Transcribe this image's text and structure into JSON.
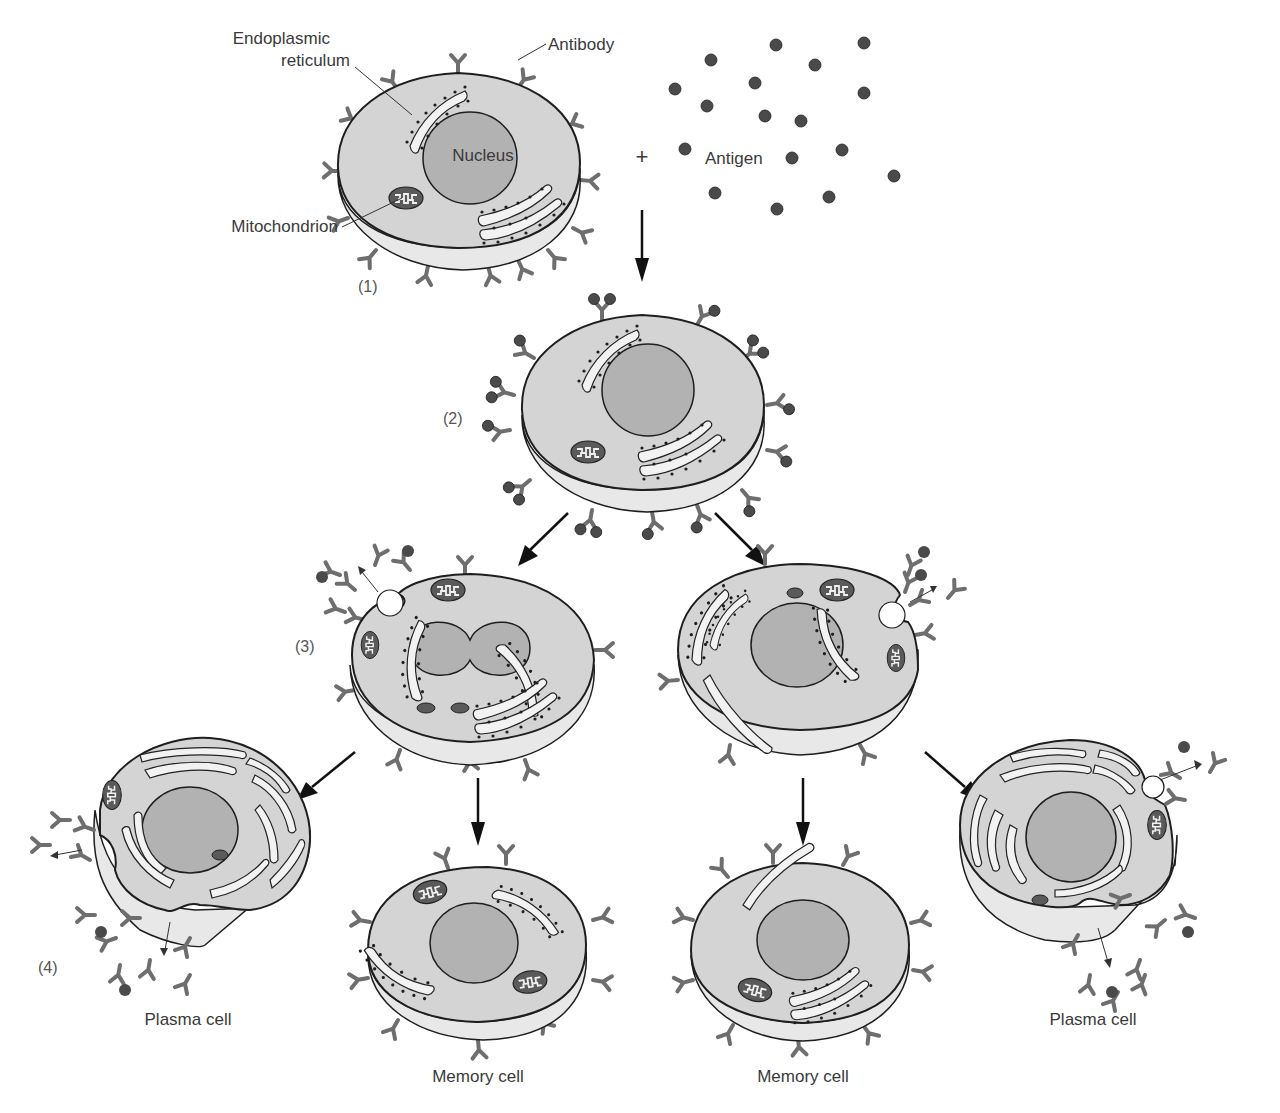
{
  "figure": {
    "domain": "diagram",
    "title_visible": false,
    "colors": {
      "cell_face": "#d4d4d4",
      "cell_side": "#e8e8e8",
      "nucleus": "#b2b2b2",
      "antibody": "#6e6e6e",
      "antigen": "#4a4a4a",
      "outline": "#1e1e1e",
      "er": "#f2f2f2",
      "text": "#3a3a3a"
    },
    "labels": {
      "endoplasmic_reticulum_line1": "Endoplasmic",
      "endoplasmic_reticulum_line2": "reticulum",
      "antibody": "Antibody",
      "nucleus": "Nucleus",
      "mitochondrion": "Mitochondrion",
      "antigen": "Antigen",
      "plus_sign": "+"
    },
    "steps": [
      {
        "id": "1",
        "label": "(1)",
        "description": "B cell with surface antibodies"
      },
      {
        "id": "2",
        "label": "(2)",
        "description": "Antigen binds to surface antibodies"
      },
      {
        "id": "3",
        "label": "(3)",
        "description": "Activated cell divides"
      },
      {
        "id": "4",
        "label": "(4)",
        "description": "Plasma cells secrete antibodies"
      }
    ],
    "cell_types": {
      "plasma_left": "Plasma cell",
      "memory_left": "Memory cell",
      "memory_right": "Memory cell",
      "plasma_right": "Plasma cell"
    }
  }
}
